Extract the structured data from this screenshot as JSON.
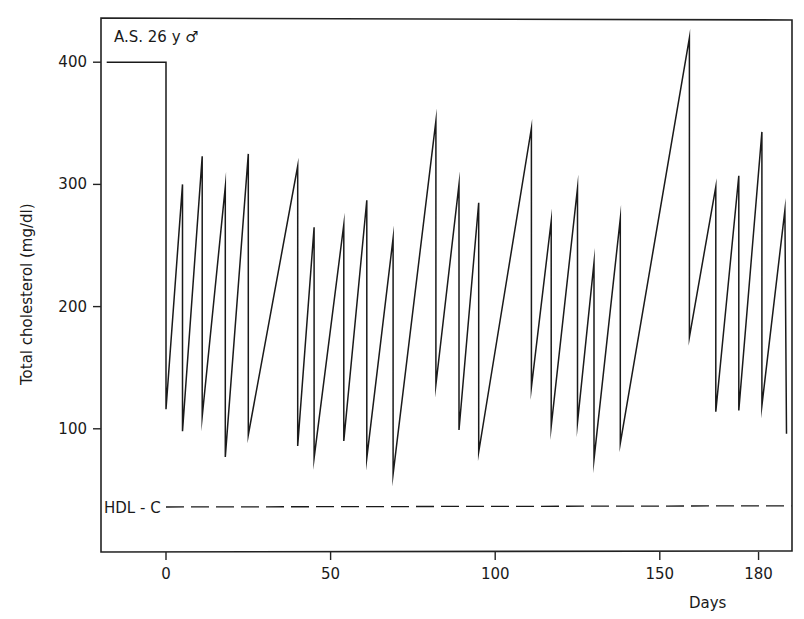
{
  "chart_data": {
    "type": "line",
    "title": "",
    "annotation": "A.S. 26 y ♂",
    "xlabel": "Days",
    "ylabel": "Total cholesterol (mg/dl)",
    "xlim": [
      -20,
      190
    ],
    "ylim": [
      0,
      435
    ],
    "x_ticks": [
      0,
      50,
      100,
      150,
      180
    ],
    "y_ticks": [
      100,
      200,
      300,
      400
    ],
    "grid": false,
    "legend": null,
    "series": [
      {
        "name": "Total cholesterol",
        "style": "solid",
        "points": [
          [
            -18,
            400
          ],
          [
            0,
            400
          ],
          [
            0,
            116
          ],
          [
            5,
            300
          ],
          [
            5,
            98
          ],
          [
            11,
            323
          ],
          [
            11,
            110
          ],
          [
            18,
            298
          ],
          [
            18,
            77
          ],
          [
            25,
            325
          ],
          [
            25,
            95
          ],
          [
            40,
            315
          ],
          [
            40,
            86
          ],
          [
            45,
            265
          ],
          [
            45,
            76
          ],
          [
            54,
            267
          ],
          [
            54,
            90
          ],
          [
            61,
            287
          ],
          [
            61,
            76
          ],
          [
            69,
            256
          ],
          [
            69,
            63
          ],
          [
            82,
            352
          ],
          [
            82,
            136
          ],
          [
            89,
            300
          ],
          [
            89,
            99
          ],
          [
            95,
            285
          ],
          [
            95,
            81
          ],
          [
            111,
            346
          ],
          [
            111,
            134
          ],
          [
            117,
            270
          ],
          [
            117,
            102
          ],
          [
            125,
            297
          ],
          [
            125,
            105
          ],
          [
            130,
            236
          ],
          [
            130,
            75
          ],
          [
            138,
            272
          ],
          [
            138,
            88
          ],
          [
            159,
            420
          ],
          [
            159,
            175
          ],
          [
            167,
            298
          ],
          [
            167,
            114
          ],
          [
            174,
            307
          ],
          [
            174,
            115
          ],
          [
            181,
            343
          ],
          [
            181,
            119
          ],
          [
            188,
            279
          ],
          [
            188.5,
            96
          ]
        ]
      },
      {
        "name": "HDL-C",
        "label": "HDL - C",
        "style": "dashed",
        "points": [
          [
            0,
            36
          ],
          [
            190,
            37
          ]
        ]
      }
    ]
  }
}
